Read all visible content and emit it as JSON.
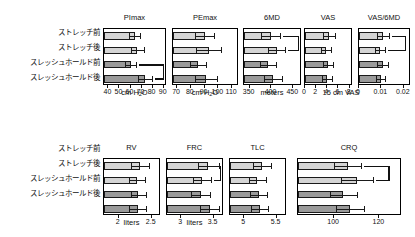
{
  "figure": {
    "group_labels": [
      "ストレッチ前",
      "ストレッチ後",
      "スレッシュホールド前",
      "スレッシュホールド後"
    ],
    "colors": {
      "light_bar": "#d5d5d5",
      "dark_bar": "#9a9a9a",
      "outline": "#1a1a1a"
    }
  },
  "chart_data": [
    {
      "type": "bar",
      "title": "PImax",
      "xlabel": "cm H2O",
      "xlabel_parts": {
        "pre": "cm H",
        "sub": "2",
        "post": "O"
      },
      "categories": [
        "ストレッチ前",
        "ストレッチ後",
        "スレッシュホールド前",
        "スレッシュホールド後"
      ],
      "values": [
        64,
        66,
        60,
        73
      ],
      "errors": [
        5,
        6,
        5,
        6
      ],
      "xlim": [
        36,
        93
      ],
      "ticks": [
        40,
        50,
        60,
        70,
        80,
        90
      ],
      "ticklabels": [
        "40",
        "50",
        "60",
        "70",
        "80",
        "90"
      ],
      "significance": [
        {
          "from": 3,
          "to": 4
        }
      ]
    },
    {
      "type": "bar",
      "title": "PEmax",
      "xlabel": "cm H2O",
      "xlabel_parts": {
        "pre": "cm H",
        "sub": "2",
        "post": "O"
      },
      "categories": [
        "ストレッチ前",
        "ストレッチ後",
        "スレッシュホールド前",
        "スレッシュホールド後"
      ],
      "values": [
        90,
        93,
        85,
        91
      ],
      "errors": [
        7,
        9,
        6,
        8
      ],
      "xlim": [
        67,
        115
      ],
      "ticks": [
        70,
        80,
        90,
        100,
        110
      ],
      "ticklabels": [
        "70",
        "80",
        "90",
        "100",
        "110"
      ],
      "significance": []
    },
    {
      "type": "bar",
      "title": "6MD",
      "xlabel": "meters",
      "categories": [
        "ストレッチ前",
        "ストレッチ後",
        "スレッシュホールド前",
        "スレッシュホールド後"
      ],
      "values": [
        398,
        412,
        392,
        404
      ],
      "errors": [
        22,
        20,
        18,
        20
      ],
      "xlim": [
        337,
        470
      ],
      "ticks": [
        350,
        400,
        450
      ],
      "ticklabels": [
        "350",
        "400",
        "450"
      ],
      "significance": [
        {
          "from": 1,
          "to": 2
        }
      ]
    },
    {
      "type": "bar",
      "title": "VAS",
      "xlabel": "15 cm VAS",
      "categories": [
        "ストレッチ前",
        "ストレッチ後",
        "スレッシュホールド前",
        "スレッシュホールド後"
      ],
      "values": [
        4.3,
        3.8,
        4.2,
        3.9
      ],
      "errors": [
        1.0,
        0.9,
        0.9,
        0.9
      ],
      "xlim": [
        0,
        8.6
      ],
      "ticks": [
        0,
        2,
        4,
        6,
        8
      ],
      "ticklabels": [
        "0",
        "2",
        "4",
        "6",
        "8"
      ],
      "significance": []
    },
    {
      "type": "bar",
      "title": "VAS/6MD",
      "xlabel": "",
      "categories": [
        "ストレッチ前",
        "ストレッチ後",
        "スレッシュホールド前",
        "スレッシュホールド後"
      ],
      "values": [
        0.0108,
        0.0092,
        0.0105,
        0.0096
      ],
      "errors": [
        0.0026,
        0.0022,
        0.0024,
        0.0022
      ],
      "xlim": [
        0,
        0.0232
      ],
      "ticks": [
        0,
        0.01,
        0.02
      ],
      "ticklabels": [
        "0",
        "0.01",
        "0.02"
      ],
      "significance": [
        {
          "from": 1,
          "to": 2
        }
      ]
    },
    {
      "type": "bar",
      "title": "RV",
      "xlabel": "liters",
      "categories": [
        "ストレッチ前",
        "ストレッチ後",
        "スレッシュホールド前",
        "スレッシュホールド後"
      ],
      "values": [
        2.32,
        2.28,
        2.3,
        2.29
      ],
      "errors": [
        0.14,
        0.12,
        0.12,
        0.13
      ],
      "xlim": [
        1.78,
        2.64
      ],
      "ticks": [
        2,
        2.5
      ],
      "ticklabels": [
        "2",
        "2.5"
      ],
      "significance": []
    },
    {
      "type": "bar",
      "title": "FRC",
      "xlabel": "liters",
      "categories": [
        "ストレッチ前",
        "ストレッチ後",
        "スレッシュホールド前",
        "スレッシュホールド後"
      ],
      "values": [
        3.42,
        3.32,
        3.3,
        3.44
      ],
      "errors": [
        0.16,
        0.14,
        0.15,
        0.15
      ],
      "xlim": [
        2.78,
        3.66
      ],
      "ticks": [
        3,
        3.5
      ],
      "ticklabels": [
        "3",
        "3.5"
      ],
      "significance": [
        {
          "from": 1,
          "to": 2
        }
      ]
    },
    {
      "type": "bar",
      "title": "TLC",
      "xlabel": "",
      "categories": [
        "ストレッチ前",
        "ストレッチ後",
        "スレッシュホールド前",
        "スレッシュホールド後"
      ],
      "values": [
        5.28,
        5.2,
        5.22,
        5.24
      ],
      "errors": [
        0.14,
        0.13,
        0.13,
        0.13
      ],
      "xlim": [
        4.78,
        5.66
      ],
      "ticks": [
        5,
        5.5
      ],
      "ticklabels": [
        "5",
        "5.5"
      ],
      "significance": []
    },
    {
      "type": "bar",
      "title": "CRQ",
      "xlabel": "",
      "categories": [
        "ストレッチ前",
        "ストレッチ後",
        "スレッシュホールド前",
        "スレッシュホールド後"
      ],
      "values": [
        106,
        110,
        104,
        107
      ],
      "errors": [
        6,
        7,
        6,
        6
      ],
      "xlim": [
        84,
        130
      ],
      "ticks": [
        100,
        120
      ],
      "ticklabels": [
        "100",
        "120"
      ],
      "significance": [
        {
          "from": 1,
          "to": 2
        }
      ]
    }
  ]
}
